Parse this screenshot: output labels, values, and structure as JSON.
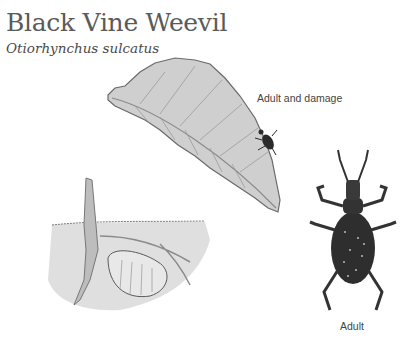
{
  "title": "Black Vine Weevil",
  "scientific_name": "Otiorhynchus sulcatus",
  "labels": {
    "adult_and_damage": "Adult and damage",
    "adult": "Adult"
  },
  "illustrations": [
    {
      "name": "leaf-with-notched-edges",
      "caption_ref": "labels.adult_and_damage"
    },
    {
      "name": "larva-in-soil-at-root",
      "caption_ref": null
    },
    {
      "name": "adult-weevil",
      "caption_ref": "labels.adult"
    }
  ],
  "colors": {
    "title": "#5a5a5a",
    "leaf_fill": "#c9c9c9",
    "leaf_stroke": "#6a6a6a",
    "soil": "#d8d8d8",
    "weevil": "#2a2a2a",
    "background": "#ffffff"
  }
}
